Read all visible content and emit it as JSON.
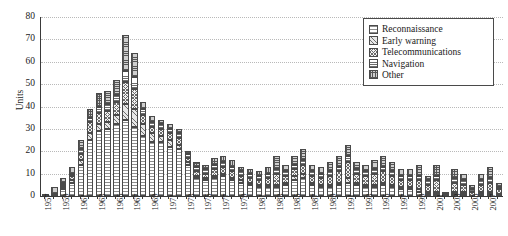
{
  "chart_data": {
    "type": "bar",
    "stacked": true,
    "title": "",
    "xlabel": "",
    "ylabel": "Units",
    "ylim": [
      0,
      80
    ],
    "yticks": [
      0,
      10,
      20,
      30,
      40,
      50,
      60,
      70,
      80
    ],
    "grid": true,
    "legend_position": "top-right",
    "legend": [
      "Reconnaissance",
      "Early warning",
      "Telecommunications",
      "Navigation",
      "Other"
    ],
    "categories": [
      "1957",
      "1958",
      "1959",
      "1960",
      "1961",
      "1962",
      "1963",
      "1964",
      "1965",
      "1966",
      "1967",
      "1968",
      "1969",
      "1970",
      "1971",
      "1972",
      "1973",
      "1974",
      "1975",
      "1976",
      "1977",
      "1978",
      "1979",
      "1980",
      "1981",
      "1982",
      "1983",
      "1984",
      "1985",
      "1986",
      "1987",
      "1988",
      "1989",
      "1990",
      "1991",
      "1992",
      "1993",
      "1994",
      "1995",
      "1996",
      "1997",
      "1998",
      "1999",
      "2000",
      "2001",
      "2002",
      "2003",
      "2004",
      "2005",
      "2006",
      "2007",
      "2008"
    ],
    "tick_labels": [
      "1957",
      "",
      "1959",
      "",
      "1961",
      "",
      "1963",
      "",
      "1965",
      "",
      "1967",
      "",
      "1969",
      "",
      "1971",
      "",
      "1973",
      "",
      "1975",
      "",
      "1977",
      "",
      "1979",
      "",
      "1981",
      "",
      "1983",
      "",
      "1985",
      "",
      "1987",
      "",
      "1989",
      "",
      "1991",
      "",
      "1993",
      "",
      "1995",
      "",
      "1997",
      "",
      "1999",
      "",
      "2001",
      "",
      "2003",
      "",
      "2005",
      "",
      "2007",
      ""
    ],
    "series": [
      {
        "name": "Reconnaissance",
        "pattern": "horizontal-sparse",
        "values": [
          0,
          1,
          3,
          6,
          14,
          25,
          29,
          30,
          32,
          34,
          31,
          27,
          24,
          24,
          22,
          21,
          14,
          8,
          7,
          8,
          9,
          7,
          6,
          5,
          4,
          4,
          4,
          5,
          7,
          8,
          5,
          4,
          4,
          5,
          6,
          5,
          4,
          4,
          5,
          4,
          3,
          3,
          2,
          1,
          1,
          0,
          1,
          1,
          0,
          1,
          1,
          1
        ]
      },
      {
        "name": "Early warning",
        "pattern": "diagonal-hatch",
        "values": [
          0,
          0,
          1,
          1,
          2,
          3,
          3,
          3,
          4,
          7,
          8,
          5,
          4,
          3,
          3,
          2,
          1,
          1,
          1,
          1,
          1,
          1,
          1,
          1,
          1,
          1,
          1,
          1,
          2,
          2,
          1,
          1,
          1,
          1,
          2,
          1,
          1,
          1,
          1,
          1,
          1,
          1,
          1,
          1,
          1,
          0,
          1,
          1,
          0,
          1,
          1,
          0
        ]
      },
      {
        "name": "Telecommunications",
        "pattern": "cross-hatch",
        "values": [
          0,
          0,
          1,
          2,
          3,
          5,
          5,
          5,
          6,
          10,
          9,
          4,
          3,
          3,
          3,
          3,
          2,
          2,
          2,
          3,
          3,
          3,
          2,
          2,
          2,
          3,
          5,
          3,
          3,
          4,
          3,
          3,
          4,
          5,
          7,
          4,
          4,
          5,
          5,
          4,
          3,
          3,
          4,
          3,
          5,
          1,
          4,
          3,
          2,
          3,
          4,
          2
        ]
      },
      {
        "name": "Navigation",
        "pattern": "horizontal-dense",
        "values": [
          0,
          0,
          1,
          1,
          2,
          2,
          3,
          3,
          3,
          5,
          5,
          3,
          2,
          2,
          2,
          2,
          2,
          2,
          2,
          2,
          2,
          2,
          2,
          2,
          2,
          2,
          2,
          2,
          2,
          2,
          2,
          2,
          2,
          2,
          3,
          2,
          2,
          2,
          2,
          2,
          2,
          2,
          2,
          2,
          2,
          0,
          2,
          2,
          1,
          2,
          2,
          1
        ]
      },
      {
        "name": "Other",
        "pattern": "dotted-dense",
        "values": [
          1,
          3,
          2,
          3,
          4,
          4,
          6,
          6,
          7,
          16,
          11,
          3,
          3,
          2,
          2,
          2,
          1,
          2,
          2,
          3,
          3,
          3,
          2,
          2,
          2,
          3,
          6,
          3,
          4,
          5,
          3,
          3,
          4,
          5,
          5,
          3,
          3,
          4,
          5,
          4,
          3,
          3,
          5,
          2,
          5,
          1,
          4,
          3,
          2,
          3,
          5,
          2
        ]
      }
    ],
    "totals": [
      1,
      4,
      8,
      13,
      25,
      39,
      46,
      47,
      52,
      72,
      64,
      42,
      36,
      34,
      32,
      30,
      20,
      15,
      14,
      17,
      18,
      16,
      13,
      12,
      11,
      13,
      18,
      14,
      18,
      21,
      14,
      13,
      15,
      18,
      23,
      15,
      14,
      16,
      18,
      15,
      12,
      12,
      14,
      9,
      14,
      2,
      12,
      10,
      5,
      10,
      13,
      6
    ]
  }
}
